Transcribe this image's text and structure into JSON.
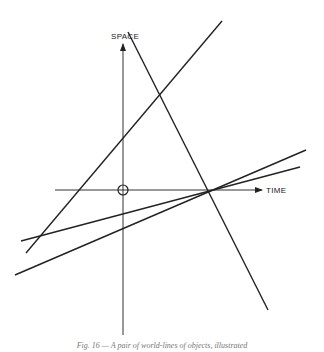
{
  "diagram": {
    "axes": {
      "vertical_label": "SPACE",
      "horizontal_label": "TIME",
      "origin_marker": "circle"
    },
    "lines": [
      {
        "name": "rising-steep-line",
        "x1": 26,
        "y1": 253,
        "x2": 222,
        "y2": 21
      },
      {
        "name": "falling-steep-line",
        "x1": 128,
        "y1": 32,
        "x2": 268,
        "y2": 310
      },
      {
        "name": "shallow-line-upper",
        "x1": 21,
        "y1": 241,
        "x2": 300,
        "y2": 167
      },
      {
        "name": "shallow-line-lower",
        "x1": 15,
        "y1": 275,
        "x2": 306,
        "y2": 150
      }
    ],
    "caption": "Fig. 16 — A pair of world-lines of objects, illustrated"
  }
}
